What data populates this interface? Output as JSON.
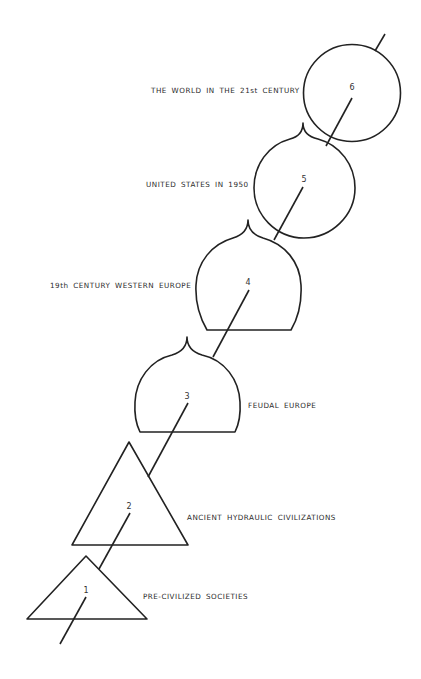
{
  "diagram": {
    "type": "evolutionary-stage-sequence",
    "stages": [
      {
        "number": "1",
        "label": "PRE-CIVILIZED SOCIETIES",
        "shape": "triangle"
      },
      {
        "number": "2",
        "label": "ANCIENT HYDRAULIC CIVILIZATIONS",
        "shape": "triangle"
      },
      {
        "number": "3",
        "label": "FEUDAL EUROPE",
        "shape": "onion-dome"
      },
      {
        "number": "4",
        "label": "19th CENTURY WESTERN EUROPE",
        "shape": "onion-dome"
      },
      {
        "number": "5",
        "label": "UNITED STATES IN 1950",
        "shape": "pointed-circle"
      },
      {
        "number": "6",
        "label": "THE WORLD IN THE 21st CENTURY",
        "shape": "circle"
      }
    ],
    "colors": {
      "stroke": "#222222",
      "text": "#2a2a2a",
      "background": "#ffffff"
    }
  }
}
